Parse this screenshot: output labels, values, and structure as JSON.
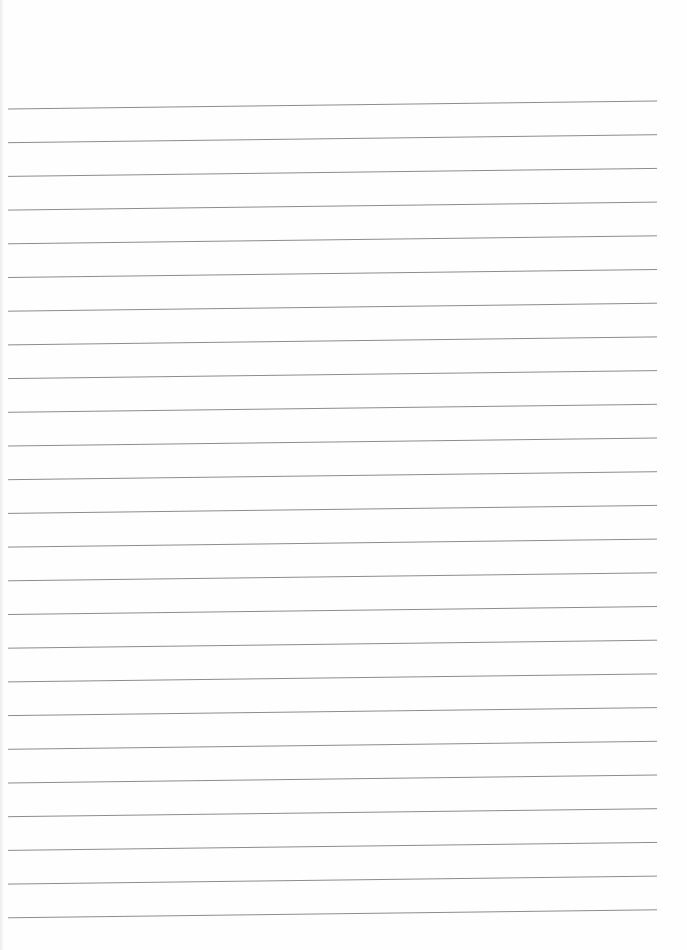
{
  "page": {
    "type": "lined-paper",
    "background": "#ffffff",
    "line_color": "#8c8c8c",
    "line_count": 25,
    "line_spacing_px": 33.7,
    "first_line_y_left": 109,
    "first_line_y_right": 101,
    "line_x_start": 8,
    "line_x_end": 657
  }
}
